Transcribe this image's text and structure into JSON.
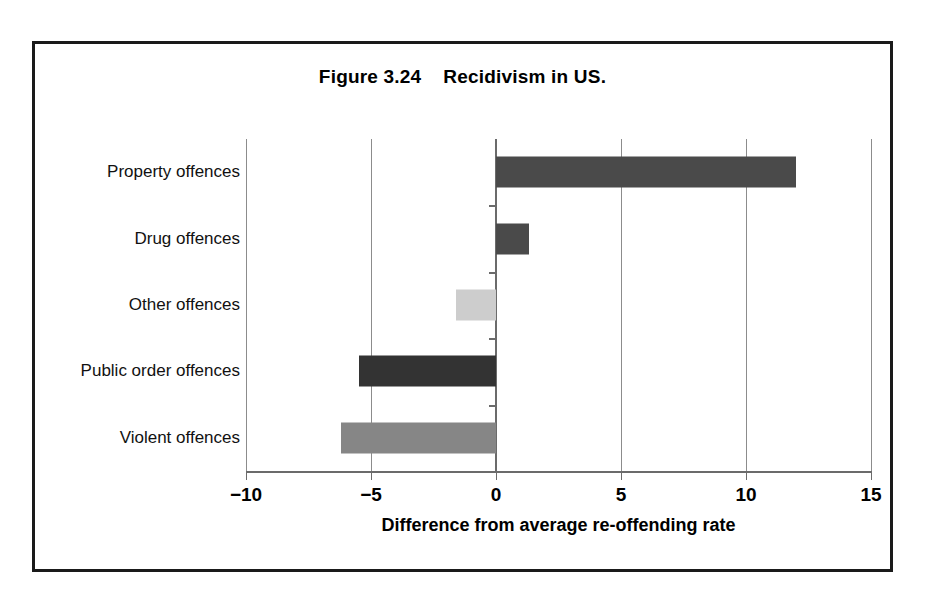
{
  "figure": {
    "title": "Figure 3.24    Recidivism in US."
  },
  "chart_data": {
    "type": "bar",
    "orientation": "horizontal",
    "title": "Figure 3.24    Recidivism in US.",
    "xlabel": "Difference from average re-offending rate",
    "ylabel": "",
    "xlim": [
      -10,
      15
    ],
    "xticks": [
      "−10",
      "−5",
      "0",
      "5",
      "10",
      "15"
    ],
    "xtick_values": [
      -10,
      -5,
      0,
      5,
      10,
      15
    ],
    "grid": "vertical",
    "legend": "none",
    "categories": [
      "Property offences",
      "Drug offences",
      "Other offences",
      "Public order offences",
      "Violent offences"
    ],
    "values": [
      12,
      1.3,
      -1.6,
      -5.5,
      -6.2
    ],
    "bar_colors": [
      "#4a4a4a",
      "#4a4a4a",
      "#cdcdcd",
      "#333333",
      "#868686"
    ]
  },
  "colors": {
    "frame": "#1a1a1a",
    "axis": "#6b6b6b",
    "grid": "#8c8c8c",
    "background": "#ffffff",
    "text": "#000000"
  }
}
